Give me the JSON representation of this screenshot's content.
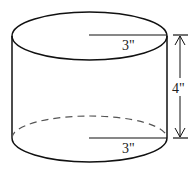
{
  "figure": {
    "shape": "cylinder",
    "labels": {
      "top_radius": "3\"",
      "bottom_radius": "3\"",
      "height": "4\""
    },
    "colors": {
      "stroke": "#111111",
      "background": "#ffffff"
    }
  }
}
